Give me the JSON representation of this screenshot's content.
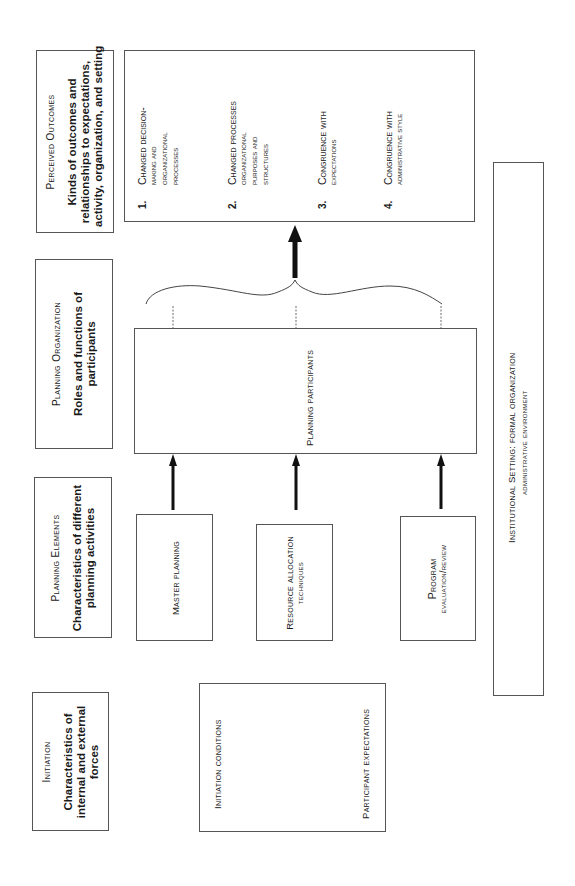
{
  "headers": {
    "perceived_outcomes": {
      "title": "Perceived Outcomes",
      "desc_lines": [
        "Kinds of outcomes and",
        "relationships to expectations,",
        "activity, organization, and setting"
      ]
    },
    "planning_organization": {
      "title": "Planning Organization",
      "desc_lines": [
        "Roles and functions of",
        "participants"
      ]
    },
    "planning_elements": {
      "title": "Planning Elements",
      "desc_lines": [
        "Characteristics of different",
        "planning activities"
      ]
    },
    "initiation": {
      "title": "Initiation",
      "desc_lines": [
        "Characteristics of",
        "internal and external",
        "forces"
      ]
    }
  },
  "outcomes": [
    {
      "num": "1.",
      "lines": [
        "Changed decision-",
        "making and",
        "organizational",
        "processes"
      ]
    },
    {
      "num": "2.",
      "lines": [
        "Changed processes",
        "organizational",
        "purposes and",
        "structures"
      ]
    },
    {
      "num": "3.",
      "lines": [
        "Congruence with",
        "expectations"
      ]
    },
    {
      "num": "4.",
      "lines": [
        "Congruence with",
        "administrative style"
      ]
    }
  ],
  "participants": {
    "label": "Planning participants"
  },
  "elements": [
    {
      "lines": [
        "Master planning"
      ]
    },
    {
      "lines": [
        "Resource allocation",
        "techniques"
      ]
    },
    {
      "lines": [
        "Program",
        "evaluation/review"
      ]
    }
  ],
  "initiation_box": {
    "conditions": "Initiation conditions",
    "expectations": "Participant expectations"
  },
  "institutional_setting": {
    "line1": "Institutional Setting: formal organization",
    "line2": "administrative environment"
  },
  "colors": {
    "line": "#555555",
    "arrow": "#111111",
    "text": "#1a1a1a"
  }
}
